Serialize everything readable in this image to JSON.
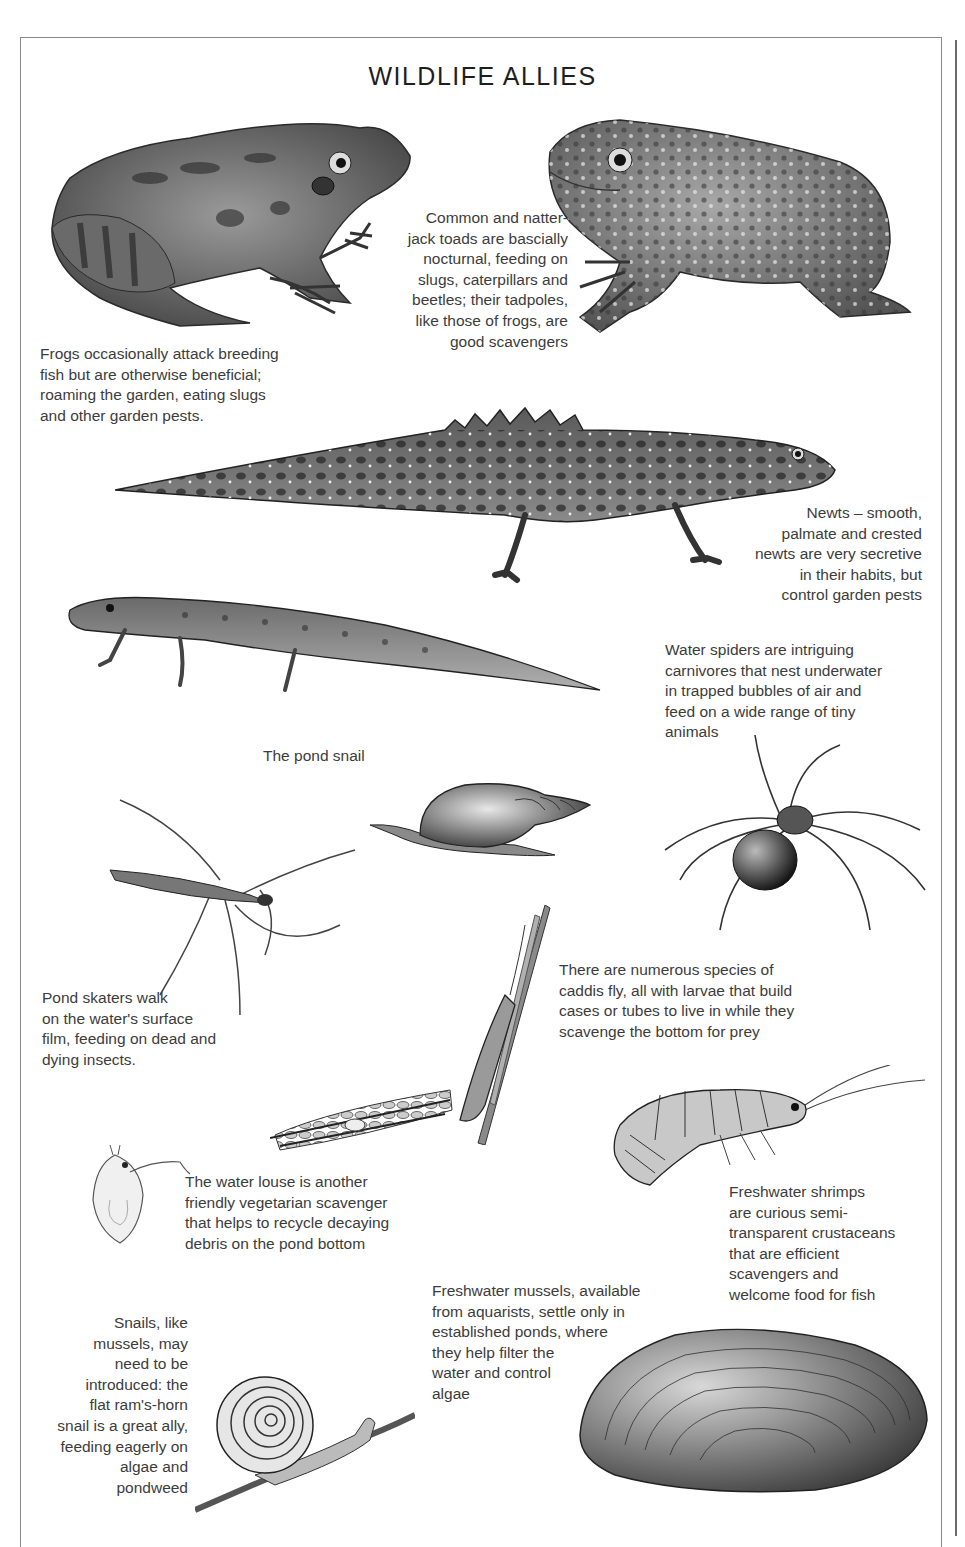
{
  "page": {
    "title": "WILDLIFE ALLIES"
  },
  "captions": {
    "toads": "Common and natter-\njack toads are bascially\nnocturnal, feeding on\nslugs, caterpillars and\nbeetles; their tadpoles,\nlike those of frogs, are\ngood scavengers",
    "frogs": "Frogs occasionally attack breeding\nfish but are otherwise beneficial;\nroaming the garden, eating slugs\nand other garden pests.",
    "newts": "Newts – smooth,\npalmate and crested\nnewts are very secretive\nin their habits, but\ncontrol garden pests",
    "water_spiders": "Water spiders are intriguing\ncarnivores that nest underwater\nin trapped bubbles of air and\nfeed on a wide range of tiny\nanimals",
    "pond_snail": "The pond snail",
    "pond_skaters": "Pond skaters walk\non the water's surface\nfilm, feeding on dead and\ndying insects.",
    "caddis_fly": "There are numerous species of\ncaddis fly, all with larvae that build\ncases or tubes to live in while they\nscavenge the bottom for prey",
    "water_louse": "The water louse is another\nfriendly vegetarian scavenger\nthat helps to recycle decaying\ndebris on the pond bottom",
    "shrimps": "Freshwater shrimps\nare curious semi-\ntransparent crustaceans\nthat are efficient\nscavengers and\nwelcome food for fish",
    "mussels": "Freshwater mussels, available\nfrom aquarists, settle only in\nestablished ponds, where\nthey help filter the\nwater and control\nalgae",
    "snails": "Snails, like\nmussels, may\nneed to be\nintroduced: the\nflat ram's-horn\nsnail is a great ally,\nfeeding eagerly on\nalgae and\npondweed"
  },
  "illustrations": [
    {
      "name": "common-frog",
      "label": "Frog"
    },
    {
      "name": "common-toad",
      "label": "Toad"
    },
    {
      "name": "crested-newt",
      "label": "Crested newt"
    },
    {
      "name": "smooth-newt",
      "label": "Smooth newt"
    },
    {
      "name": "pond-snail",
      "label": "Pond snail"
    },
    {
      "name": "water-spider",
      "label": "Water spider"
    },
    {
      "name": "pond-skater",
      "label": "Pond skater"
    },
    {
      "name": "caddis-fly",
      "label": "Caddis fly"
    },
    {
      "name": "caddis-larva-case",
      "label": "Caddis larva case"
    },
    {
      "name": "water-louse",
      "label": "Water louse"
    },
    {
      "name": "freshwater-shrimp",
      "label": "Freshwater shrimp"
    },
    {
      "name": "ramshorn-snail",
      "label": "Ram's-horn snail"
    },
    {
      "name": "freshwater-mussel",
      "label": "Freshwater mussel"
    }
  ],
  "colors": {
    "ink": "#3c3c3c",
    "title": "#1e1e1e",
    "border": "#8a8a8a"
  }
}
